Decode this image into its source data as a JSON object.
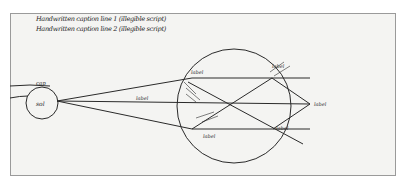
{
  "document": {
    "type": "manuscript diagram",
    "caption_lines": [
      "Handwritten caption line 1 (illegible script)",
      "Handwritten caption line 2 (illegible script)"
    ]
  },
  "diagram": {
    "small_circle": {
      "label": "sol",
      "top_label": "cap"
    },
    "large_circle_labels": {
      "top_left": "label",
      "top_right": "label",
      "middle_left": "label",
      "right_apex": "label",
      "lower_right": "label",
      "lower_left": "label"
    }
  },
  "colors": {
    "ink": "#2a2a2a",
    "paper": "#f4f4f2",
    "border": "#9a9a9a"
  }
}
